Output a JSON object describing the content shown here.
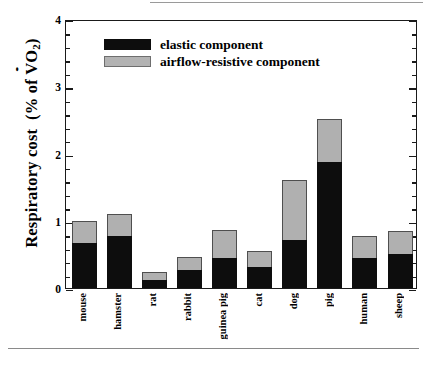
{
  "chart_data": {
    "type": "bar",
    "title": "",
    "xlabel": "",
    "ylabel": "Respiratory cost  (% of V̇O₂)",
    "ylabel_parts": {
      "prefix": "Respiratory cost  (% of ",
      "dotted": "V",
      "sub": "O",
      "subscript": "2",
      "suffix": ")"
    },
    "ylim": [
      0,
      4
    ],
    "yticks": [
      0,
      1,
      2,
      3,
      4
    ],
    "ytick_labels": [
      "0",
      "1",
      "2",
      "3",
      "4"
    ],
    "minor_tick_step": 0.2,
    "grid": false,
    "stacked": true,
    "legend_position": "top-left",
    "categories": [
      "mouse",
      "hamster",
      "rat",
      "rabbit",
      "guinea pig",
      "cat",
      "dog",
      "pig",
      "human",
      "sheep"
    ],
    "series": [
      {
        "name": "elastic component",
        "color": "#0d0d0d",
        "values": [
          0.67,
          0.78,
          0.12,
          0.27,
          0.45,
          0.31,
          0.72,
          1.88,
          0.45,
          0.51
        ]
      },
      {
        "name": "airflow-resistive component",
        "color": "#b0b0b0",
        "values": [
          0.33,
          0.32,
          0.12,
          0.19,
          0.42,
          0.24,
          0.89,
          0.63,
          0.32,
          0.34
        ]
      }
    ],
    "totals": [
      1.0,
      1.1,
      0.24,
      0.46,
      0.87,
      0.55,
      1.61,
      2.51,
      0.77,
      0.85
    ]
  },
  "legend": {
    "items": [
      {
        "label": "elastic component",
        "swatch": "black-swatch"
      },
      {
        "label": "airflow-resistive component",
        "swatch": "gray-swatch"
      }
    ]
  },
  "axes": {
    "y_tick_labels": [
      "4",
      "3",
      "2",
      "1",
      "0"
    ]
  }
}
